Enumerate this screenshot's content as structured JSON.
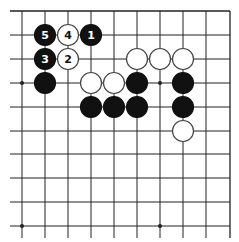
{
  "diagram": {
    "type": "go-board-fragment",
    "grid": {
      "columns": 10,
      "rows": 10,
      "x_positions": [
        22,
        45,
        68,
        91,
        114,
        137,
        160,
        183,
        206,
        230
      ],
      "y_positions": [
        11,
        35,
        59,
        83,
        107,
        131,
        154,
        178,
        202,
        226
      ],
      "edges": {
        "top": true,
        "right": true,
        "left": false,
        "bottom": false
      },
      "line_color": "#222222",
      "star_points": [
        {
          "col": 0,
          "row": 3
        },
        {
          "col": 6,
          "row": 3
        },
        {
          "col": 0,
          "row": 9
        },
        {
          "col": 6,
          "row": 9
        }
      ]
    },
    "stones": [
      {
        "color": "black",
        "col": 1,
        "row": 1,
        "label": "5"
      },
      {
        "color": "white",
        "col": 2,
        "row": 1,
        "label": "4"
      },
      {
        "color": "black",
        "col": 3,
        "row": 1,
        "label": "1"
      },
      {
        "color": "black",
        "col": 1,
        "row": 2,
        "label": "3"
      },
      {
        "color": "white",
        "col": 2,
        "row": 2,
        "label": "2"
      },
      {
        "color": "white",
        "col": 5,
        "row": 2,
        "label": ""
      },
      {
        "color": "white",
        "col": 6,
        "row": 2,
        "label": ""
      },
      {
        "color": "white",
        "col": 7,
        "row": 2,
        "label": ""
      },
      {
        "color": "black",
        "col": 1,
        "row": 3,
        "label": ""
      },
      {
        "color": "white",
        "col": 3,
        "row": 3,
        "label": ""
      },
      {
        "color": "white",
        "col": 4,
        "row": 3,
        "label": ""
      },
      {
        "color": "black",
        "col": 5,
        "row": 3,
        "label": ""
      },
      {
        "color": "black",
        "col": 7,
        "row": 3,
        "label": ""
      },
      {
        "color": "black",
        "col": 3,
        "row": 4,
        "label": ""
      },
      {
        "color": "black",
        "col": 4,
        "row": 4,
        "label": ""
      },
      {
        "color": "black",
        "col": 5,
        "row": 4,
        "label": ""
      },
      {
        "color": "black",
        "col": 7,
        "row": 4,
        "label": ""
      },
      {
        "color": "white",
        "col": 7,
        "row": 5,
        "label": ""
      }
    ],
    "colors": {
      "black_stone": "#111111",
      "white_stone": "#ffffff",
      "white_stone_border": "#444444",
      "label_on_black": "#ffffff",
      "label_on_white": "#111111"
    }
  }
}
